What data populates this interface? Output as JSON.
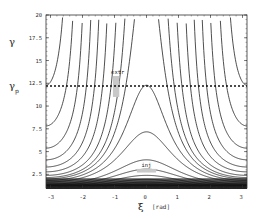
{
  "chart_data": {
    "type": "contour",
    "title": "",
    "xlabel": "ξ",
    "xlabel_unit": "[rad]",
    "ylabel": "γ",
    "xlim": [
      -3.14,
      3.14
    ],
    "ylim": [
      1,
      20
    ],
    "x_ticks": [
      "-3",
      "-2",
      "-1",
      "0",
      "1",
      "2",
      "3"
    ],
    "x_tick_values": [
      -3,
      -2,
      -1,
      0,
      1,
      2,
      3
    ],
    "y_ticks": [
      "2.5",
      "5",
      "7.5",
      "10",
      "12.5",
      "15",
      "17.5",
      "20"
    ],
    "y_tick_values": [
      2.5,
      5,
      7.5,
      10,
      12.5,
      15,
      17.5,
      20
    ],
    "grid": false,
    "reference_line": {
      "label": "γ",
      "label_sub": "p",
      "value": 12.2,
      "style": "dashed"
    },
    "annotations": [
      {
        "text": "extr",
        "x": -0.95,
        "y": 12.5,
        "box": {
          "x0": -1.05,
          "x1": -0.85,
          "y0": 11.0,
          "y1": 13.3
        }
      },
      {
        "text": "inj",
        "x": 0.0,
        "y": 4.0,
        "box": {
          "x0": -0.3,
          "x1": 0.3,
          "y0": 2.7,
          "y1": 3.1
        }
      }
    ],
    "contour_model": "gamma = A / (c - cos(xi))",
    "contour_A": 4.3,
    "contour_levels": [
      2.05,
      1.6,
      1.35,
      1.15,
      1.0,
      0.8,
      0.55,
      0.3,
      0.05,
      -0.2,
      -0.45,
      -0.65,
      -0.8,
      -0.9,
      -0.96,
      2.4,
      2.8,
      3.2,
      3.6,
      4.0,
      4.5,
      5.0,
      5.6,
      6.2,
      7.0,
      8.0,
      9.0,
      10.5,
      12.0,
      14.0,
      16.0
    ]
  },
  "axes": {
    "y_label": "γ",
    "ref_label": "γ",
    "ref_sub": "p",
    "x_label": "ξ",
    "x_unit": "[rad]"
  },
  "annotations": {
    "extr": "extr",
    "inj": "inj"
  }
}
